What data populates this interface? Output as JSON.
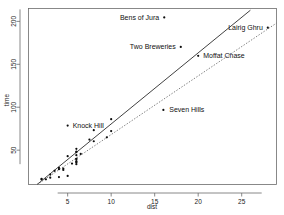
{
  "chart_data": {
    "type": "scatter",
    "title": "",
    "xlabel": "dist",
    "ylabel": "time",
    "xlim": [
      0.5,
      29.0
    ],
    "ylim": [
      10,
      215
    ],
    "grid": false,
    "legend": "none",
    "xticks": [
      5,
      10,
      15,
      20,
      25
    ],
    "yticks": [
      50,
      100,
      150,
      200
    ],
    "xtick_labels": [
      "5",
      "10",
      "15",
      "20",
      "25"
    ],
    "ytick_labels": [
      "50",
      "100",
      "150",
      "200"
    ],
    "points": [
      {
        "dist": 2.5,
        "time": 16.08,
        "label": ""
      },
      {
        "dist": 6.0,
        "time": 48.35,
        "label": ""
      },
      {
        "dist": 6.0,
        "time": 33.65,
        "label": ""
      },
      {
        "dist": 6.5,
        "time": 45.6,
        "label": ""
      },
      {
        "dist": 7.5,
        "time": 62.27,
        "label": ""
      },
      {
        "dist": 8.0,
        "time": 73.22,
        "label": ""
      },
      {
        "dist": 8.0,
        "time": 60.4,
        "label": ""
      },
      {
        "dist": 16.0,
        "time": 96.88,
        "label": "Seven Hills"
      },
      {
        "dist": 6.0,
        "time": 51.5,
        "label": ""
      },
      {
        "dist": 5.0,
        "time": 78.65,
        "label": "Knock Hill"
      },
      {
        "dist": 6.0,
        "time": 39.75,
        "label": ""
      },
      {
        "dist": 28.0,
        "time": 192.67,
        "label": "Lairig Ghru"
      },
      {
        "dist": 5.0,
        "time": 43.05,
        "label": ""
      },
      {
        "dist": 9.5,
        "time": 65.0,
        "label": ""
      },
      {
        "dist": 6.0,
        "time": 44.13,
        "label": ""
      },
      {
        "dist": 4.5,
        "time": 26.93,
        "label": ""
      },
      {
        "dist": 10.0,
        "time": 72.25,
        "label": ""
      },
      {
        "dist": 6.0,
        "time": 36.37,
        "label": ""
      },
      {
        "dist": 18.0,
        "time": 170.25,
        "label": "Two Breweries"
      },
      {
        "dist": 4.5,
        "time": 28.57,
        "label": ""
      },
      {
        "dist": 20.0,
        "time": 159.83,
        "label": "Moffat Chase"
      },
      {
        "dist": 5.5,
        "time": 34.43,
        "label": ""
      },
      {
        "dist": 3.0,
        "time": 21.65,
        "label": ""
      },
      {
        "dist": 3.5,
        "time": 25.97,
        "label": ""
      },
      {
        "dist": 6.0,
        "time": 39.75,
        "label": ""
      },
      {
        "dist": 2.0,
        "time": 16.63,
        "label": ""
      },
      {
        "dist": 3.0,
        "time": 17.93,
        "label": ""
      },
      {
        "dist": 4.0,
        "time": 18.68,
        "label": ""
      },
      {
        "dist": 6.0,
        "time": 37.35,
        "label": ""
      },
      {
        "dist": 5.0,
        "time": 19.95,
        "label": ""
      },
      {
        "dist": 6.0,
        "time": 35.75,
        "label": ""
      },
      {
        "dist": 2.0,
        "time": 15.95,
        "label": ""
      },
      {
        "dist": 4.0,
        "time": 27.9,
        "label": ""
      },
      {
        "dist": 6.0,
        "time": 47.63,
        "label": ""
      },
      {
        "dist": 10.0,
        "time": 86.07,
        "label": ""
      },
      {
        "dist": 4.0,
        "time": 29.45,
        "label": ""
      }
    ],
    "lines": [
      {
        "name": "least-squares-fit",
        "style": "solid",
        "x0": 1.0,
        "y0": 6.0,
        "x1": 26.0,
        "y1": 213.0
      },
      {
        "name": "robust-fit",
        "style": "dotted",
        "x0": 1.2,
        "y0": 8.0,
        "x1": 29.0,
        "y1": 198.0
      }
    ],
    "annotations": [
      {
        "label": "Bens of Jura",
        "x": 16.1,
        "y": 204.0,
        "anchor": "end",
        "dx": -5
      },
      {
        "label": "Lairig Ghru",
        "x": 28.0,
        "y": 192.7,
        "anchor": "end",
        "dx": -5
      },
      {
        "label": "Two Breweries",
        "x": 18.0,
        "y": 170.3,
        "anchor": "end",
        "dx": -5
      },
      {
        "label": "Moffat Chase",
        "x": 20.0,
        "y": 159.8,
        "anchor": "start",
        "dx": 5
      },
      {
        "label": "Seven Hills",
        "x": 16.1,
        "y": 96.9,
        "anchor": "start",
        "dx": 5
      },
      {
        "label": "Knock Hill",
        "x": 5.0,
        "y": 78.7,
        "anchor": "start",
        "dx": 5
      }
    ]
  },
  "axes": {
    "x_title": "dist",
    "y_title": "time"
  },
  "colors": {
    "point": "#0d0d0d",
    "frame": "#6b6b6b",
    "solid_line": "#2b2b2b",
    "dotted_line": "#6f6f6f",
    "text": "#1a1a1a",
    "background": "#ffffff"
  }
}
